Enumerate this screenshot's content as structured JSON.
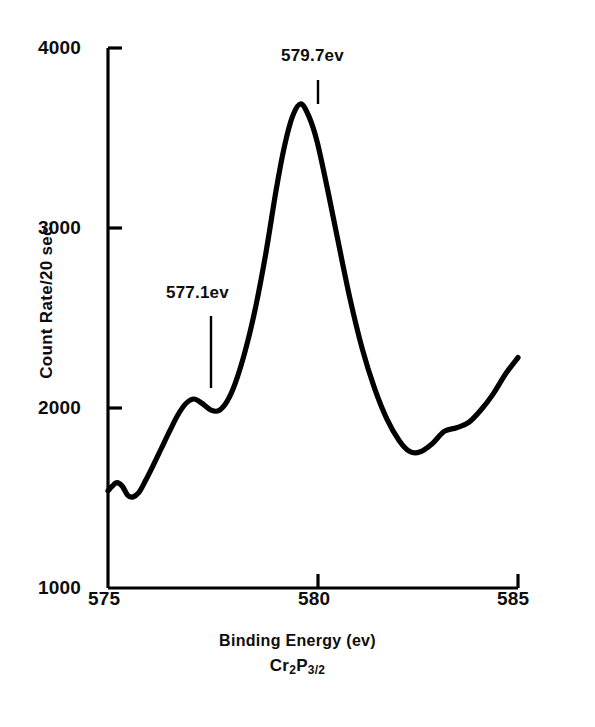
{
  "figure": {
    "background_color": "#ffffff",
    "line_color": "#000000"
  },
  "axes": {
    "y_title": "Count Rate/20 sec.",
    "x_title": "Binding Energy (ev)",
    "x_subtitle_prefix": "Cr",
    "x_subtitle_sub1": "2",
    "x_subtitle_mid": "P",
    "x_subtitle_sub2": "3/2",
    "y_ticks": [
      "4000",
      "3000",
      "2000",
      "1000"
    ],
    "x_ticks": [
      "575",
      "580",
      "585"
    ]
  },
  "annotations": [
    {
      "label": "579.7ev",
      "x": 579.7,
      "y": 3690
    },
    {
      "label": "577.1ev",
      "x": 577.1,
      "y": 2050
    }
  ],
  "chart_data": {
    "type": "line",
    "title": "",
    "subtitle": "Cr2P3/2",
    "xlabel": "Binding Energy (ev)",
    "ylabel": "Count Rate/20 sec.",
    "xlim": [
      575,
      585
    ],
    "ylim": [
      1000,
      4000
    ],
    "xticks": [
      575,
      580,
      585
    ],
    "yticks": [
      1000,
      2000,
      3000,
      4000
    ],
    "grid": false,
    "legend": null,
    "series": [
      {
        "name": "Cr 2p3/2 XPS spectrum",
        "color": "#000000",
        "x": [
          575.0,
          575.1,
          575.22,
          575.35,
          575.48,
          575.6,
          575.75,
          575.9,
          576.1,
          576.3,
          576.5,
          576.7,
          576.9,
          577.1,
          577.3,
          577.5,
          577.7,
          577.9,
          578.1,
          578.35,
          578.6,
          578.85,
          579.1,
          579.3,
          579.5,
          579.7,
          579.9,
          580.1,
          580.35,
          580.6,
          580.9,
          581.2,
          581.5,
          581.8,
          582.1,
          582.35,
          582.6,
          582.9,
          583.2,
          583.5,
          583.8,
          584.1,
          584.4,
          584.7,
          585.0
        ],
        "y": [
          1540,
          1565,
          1585,
          1565,
          1515,
          1505,
          1530,
          1590,
          1680,
          1775,
          1870,
          1960,
          2025,
          2050,
          2025,
          1990,
          1985,
          2035,
          2135,
          2320,
          2560,
          2860,
          3210,
          3450,
          3620,
          3690,
          3620,
          3480,
          3220,
          2940,
          2610,
          2330,
          2110,
          1940,
          1820,
          1760,
          1755,
          1800,
          1870,
          1890,
          1920,
          1990,
          2080,
          2190,
          2280
        ]
      }
    ],
    "annotations": [
      {
        "text": "579.7ev",
        "x": 579.7,
        "y": 3690,
        "points_to": "main peak"
      },
      {
        "text": "577.1ev",
        "x": 577.1,
        "y": 2050,
        "points_to": "shoulder peak"
      }
    ]
  }
}
